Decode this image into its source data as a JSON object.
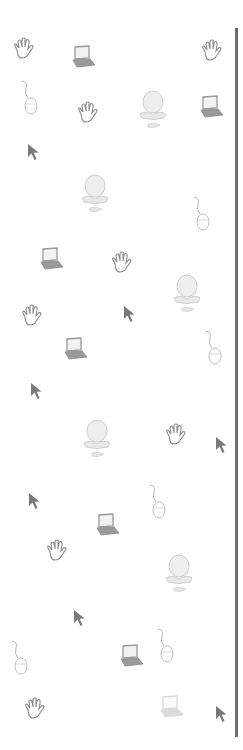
{
  "pattern": {
    "description": "Decorative wallpaper of faded computer-related clipart",
    "colors": {
      "background": "#ffffff",
      "divider": "#6e6e6e",
      "outline": "#8a8a8a",
      "cursor": "#7a7a7a",
      "laptop": "#9a9a9a",
      "faded": "#cfcfcf"
    },
    "icons": [
      {
        "type": "hand-icon",
        "x": 12,
        "y": 38
      },
      {
        "type": "laptop-icon",
        "x": 70,
        "y": 45
      },
      {
        "type": "hand-icon",
        "x": 200,
        "y": 40
      },
      {
        "type": "mouse-icon",
        "x": 20,
        "y": 80
      },
      {
        "type": "hand-icon",
        "x": 76,
        "y": 102
      },
      {
        "type": "computer-icon",
        "x": 136,
        "y": 88
      },
      {
        "type": "laptop-icon",
        "x": 198,
        "y": 95
      },
      {
        "type": "cursor-icon",
        "x": 27,
        "y": 143
      },
      {
        "type": "computer-icon",
        "x": 78,
        "y": 172
      },
      {
        "type": "mouse-icon",
        "x": 192,
        "y": 196
      },
      {
        "type": "laptop-icon",
        "x": 38,
        "y": 247
      },
      {
        "type": "hand-icon",
        "x": 110,
        "y": 252
      },
      {
        "type": "computer-icon",
        "x": 170,
        "y": 272
      },
      {
        "type": "hand-icon",
        "x": 20,
        "y": 305
      },
      {
        "type": "cursor-icon",
        "x": 123,
        "y": 305
      },
      {
        "type": "laptop-icon",
        "x": 62,
        "y": 337
      },
      {
        "type": "mouse-icon",
        "x": 204,
        "y": 330
      },
      {
        "type": "cursor-icon",
        "x": 30,
        "y": 382
      },
      {
        "type": "computer-icon",
        "x": 80,
        "y": 417
      },
      {
        "type": "hand-icon",
        "x": 164,
        "y": 424
      },
      {
        "type": "cursor-icon",
        "x": 215,
        "y": 436
      },
      {
        "type": "cursor-icon",
        "x": 28,
        "y": 492
      },
      {
        "type": "mouse-icon",
        "x": 148,
        "y": 484
      },
      {
        "type": "laptop-icon",
        "x": 94,
        "y": 513
      },
      {
        "type": "hand-icon",
        "x": 45,
        "y": 540
      },
      {
        "type": "computer-icon",
        "x": 162,
        "y": 552
      },
      {
        "type": "cursor-icon",
        "x": 73,
        "y": 609
      },
      {
        "type": "mouse-icon",
        "x": 10,
        "y": 640
      },
      {
        "type": "laptop-icon",
        "x": 118,
        "y": 644
      },
      {
        "type": "mouse-icon",
        "x": 156,
        "y": 628
      },
      {
        "type": "hand-icon",
        "x": 23,
        "y": 698
      },
      {
        "type": "laptop-icon",
        "x": 158,
        "y": 695,
        "faded": true
      },
      {
        "type": "cursor-icon",
        "x": 215,
        "y": 705
      }
    ]
  }
}
